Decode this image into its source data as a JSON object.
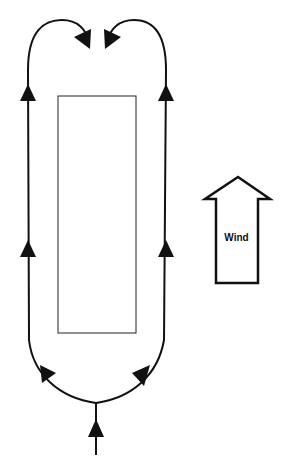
{
  "diagram": {
    "type": "airflow-circulation",
    "wind_label": "Wind",
    "colors": {
      "stroke": "#111111",
      "background": "#ffffff"
    },
    "elements": {
      "building": "rectangle",
      "flow_paths": [
        "left-loop",
        "right-loop",
        "inlet-stem"
      ],
      "wind_indicator": "up-arrow"
    }
  }
}
